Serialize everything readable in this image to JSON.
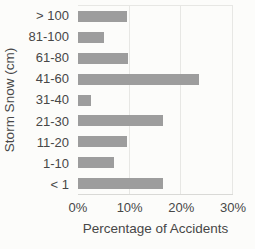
{
  "chart_data": {
    "type": "bar",
    "orientation": "horizontal",
    "title": "",
    "categories": [
      "> 100",
      "81-100",
      "61-80",
      "41-60",
      "31-40",
      "21-30",
      "11-20",
      "1-10",
      "< 1"
    ],
    "values": [
      9.5,
      5,
      9.7,
      23.5,
      2.5,
      16.5,
      9.5,
      7,
      16.5
    ],
    "xlabel": "Percentage of Accidents",
    "ylabel": "Storm Snow (cm)",
    "xlim": [
      0,
      30
    ],
    "xticks": [
      {
        "label": "0%",
        "value": 0
      },
      {
        "label": "10%",
        "value": 10
      },
      {
        "label": "20%",
        "value": 20
      },
      {
        "label": "30%",
        "value": 30
      }
    ],
    "grid": "vertical-only",
    "legend": "none",
    "bar_color": "#9d9d9d",
    "text_color": "#474747",
    "grid_color": "#e7e7e4",
    "background_color": "#fcfcfa"
  }
}
